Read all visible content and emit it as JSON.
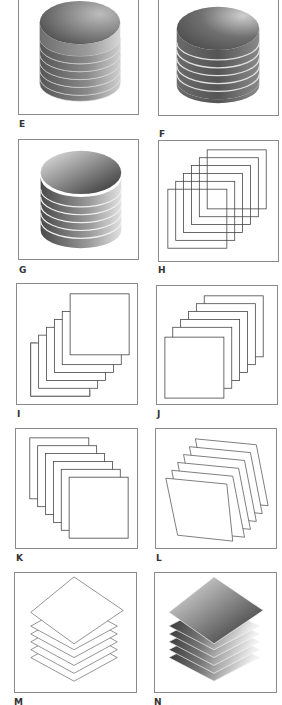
{
  "figure": {
    "panels": [
      {
        "id": "E",
        "label": "E",
        "type": "stacked-discs",
        "layers": 6,
        "fill": "gradient",
        "separators": "thin"
      },
      {
        "id": "F",
        "label": "F",
        "type": "stacked-discs",
        "layers": 6,
        "fill": "gradient",
        "separators": "white"
      },
      {
        "id": "G",
        "label": "G",
        "type": "stacked-discs",
        "layers": 6,
        "fill": "gradient-reversed",
        "separators": "white"
      },
      {
        "id": "H",
        "label": "H",
        "type": "overlapping-squares",
        "layers": 6
      },
      {
        "id": "I",
        "label": "I",
        "type": "stacked-squares-front-top-right",
        "layers": 6
      },
      {
        "id": "J",
        "label": "J",
        "type": "stacked-squares-front-bottom-left",
        "layers": 6
      },
      {
        "id": "K",
        "label": "K",
        "type": "stacked-squares-front-bottom-right",
        "layers": 6
      },
      {
        "id": "L",
        "label": "L",
        "type": "stacked-skewed-sheets",
        "layers": 6
      },
      {
        "id": "M",
        "label": "M",
        "type": "stacked-diamonds-outline",
        "layers": 6
      },
      {
        "id": "N",
        "label": "N",
        "type": "stacked-diamonds-gradient",
        "layers": 6
      }
    ],
    "colors": {
      "frame": "#8a8a8a",
      "line": "#555555",
      "dark": "#3a3a3a",
      "light": "#e8e8e8",
      "label": "#333333"
    }
  }
}
